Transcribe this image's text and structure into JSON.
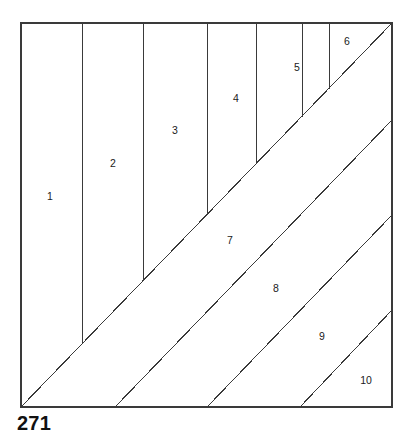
{
  "figure": {
    "caption": "271",
    "type": "geometric-dissection-diagram",
    "stroke_color": "#3a3a3a",
    "label_color": "#1a1a1a",
    "background_color": "#ffffff"
  },
  "chart_data": {
    "type": "diagram",
    "title": "271",
    "frame": {
      "left": 21,
      "top": 23,
      "right": 392,
      "bottom": 407
    },
    "main_diagonal": {
      "x1": 21,
      "y1": 407,
      "x2": 392,
      "y2": 23
    },
    "vertical_dividers": [
      {
        "x": 82,
        "y_top": 23,
        "y_bottom": 344
      },
      {
        "x": 143,
        "y_top": 23,
        "y_bottom": 281
      },
      {
        "x": 207,
        "y_top": 23,
        "y_bottom": 215
      },
      {
        "x": 256,
        "y_top": 23,
        "y_bottom": 164
      },
      {
        "x": 302,
        "y_top": 23,
        "y_bottom": 117
      },
      {
        "x": 329,
        "y_top": 23,
        "y_bottom": 89
      }
    ],
    "diagonal_bands": [
      {
        "x_bottom": 115,
        "x_right_y": 120
      },
      {
        "x_bottom": 207,
        "x_right_y": 215
      },
      {
        "x_bottom": 300,
        "x_right_y": 310
      }
    ],
    "pieces": [
      {
        "id": 1,
        "label": "1",
        "x": 50,
        "y": 197
      },
      {
        "id": 2,
        "label": "2",
        "x": 113,
        "y": 164
      },
      {
        "id": 3,
        "label": "3",
        "x": 175,
        "y": 131
      },
      {
        "id": 4,
        "label": "4",
        "x": 236,
        "y": 99
      },
      {
        "id": 5,
        "label": "5",
        "x": 297,
        "y": 68
      },
      {
        "id": 6,
        "label": "6",
        "x": 347,
        "y": 42
      },
      {
        "id": 7,
        "label": "7",
        "x": 230,
        "y": 241
      },
      {
        "id": 8,
        "label": "8",
        "x": 276,
        "y": 289
      },
      {
        "id": 9,
        "label": "9",
        "x": 322,
        "y": 337
      },
      {
        "id": 10,
        "label": "10",
        "x": 366,
        "y": 381
      }
    ]
  }
}
